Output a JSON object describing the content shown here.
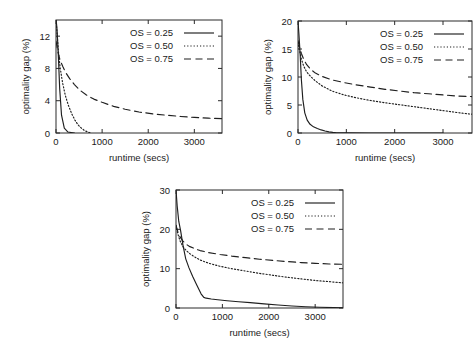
{
  "figure": {
    "background": "#ffffff",
    "ink": "#1f1f1f",
    "panel_count": 3
  },
  "legend": {
    "entries": [
      {
        "label": "OS = 0.25",
        "style": "solid"
      },
      {
        "label": "OS = 0.50",
        "style": "dotted"
      },
      {
        "label": "OS = 0.75",
        "style": "dashed"
      }
    ]
  },
  "chart_data": [
    {
      "id": "panel-top-left",
      "type": "line",
      "title": "",
      "xlabel": "runtime (secs)",
      "ylabel": "optimality gap (%)",
      "xlim": [
        0,
        3600
      ],
      "ylim": [
        0,
        14
      ],
      "xticks": [
        0,
        1000,
        2000,
        3000
      ],
      "yticks": [
        0,
        4,
        8,
        12
      ],
      "xticklabels": [
        "0",
        "1000",
        "2000",
        "3000"
      ],
      "yticklabels": [
        "0",
        "4",
        "8",
        "12"
      ],
      "grid": false,
      "legend_position": "top-right",
      "series": [
        {
          "name": "OS = 0.25",
          "style": "solid",
          "x": [
            0,
            10,
            20,
            35,
            55,
            80,
            120,
            180,
            260,
            400
          ],
          "y": [
            14.0,
            13.6,
            13.0,
            11.5,
            9.0,
            5.5,
            2.2,
            0.6,
            0.12,
            0.0
          ]
        },
        {
          "name": "OS = 0.50",
          "style": "dotted",
          "x": [
            0,
            20,
            50,
            90,
            140,
            200,
            270,
            340,
            410,
            480,
            550,
            620,
            700,
            760
          ],
          "y": [
            14.0,
            12.6,
            10.2,
            8.1,
            6.3,
            4.7,
            3.4,
            2.4,
            1.6,
            1.0,
            0.6,
            0.3,
            0.1,
            0.0
          ]
        },
        {
          "name": "OS = 0.75",
          "style": "dashed",
          "x": [
            0,
            40,
            90,
            150,
            220,
            300,
            400,
            520,
            660,
            820,
            1000,
            1250,
            1500,
            1800,
            2100,
            2400,
            2700,
            3000,
            3300,
            3600
          ],
          "y": [
            11.4,
            10.1,
            9.0,
            8.2,
            7.4,
            6.7,
            6.0,
            5.3,
            4.7,
            4.2,
            3.8,
            3.3,
            2.95,
            2.6,
            2.37,
            2.2,
            2.05,
            1.93,
            1.84,
            1.78
          ]
        }
      ]
    },
    {
      "id": "panel-top-right",
      "type": "line",
      "title": "",
      "xlabel": "runtime (secs)",
      "ylabel": "optimality gap (%)",
      "xlim": [
        0,
        3600
      ],
      "ylim": [
        0,
        20
      ],
      "xticks": [
        0,
        1000,
        2000,
        3000
      ],
      "yticks": [
        0,
        5,
        10,
        15,
        20
      ],
      "xticklabels": [
        "0",
        "1000",
        "2000",
        "3000"
      ],
      "yticklabels": [
        "0",
        "5",
        "10",
        "15",
        "20"
      ],
      "grid": false,
      "legend_position": "top-right",
      "series": [
        {
          "name": "OS = 0.25",
          "style": "solid",
          "x": [
            0,
            20,
            45,
            70,
            100,
            140,
            190,
            250,
            320,
            400,
            480,
            560,
            640,
            720,
            800,
            1000,
            1500,
            2000,
            2500,
            3000,
            3600
          ],
          "y": [
            20.0,
            17.5,
            14.0,
            9.5,
            6.0,
            3.6,
            2.3,
            1.55,
            1.1,
            0.8,
            0.55,
            0.35,
            0.2,
            0.1,
            0.05,
            0.02,
            0.0,
            0.0,
            0.0,
            0.0
          ]
        },
        {
          "name": "OS = 0.50",
          "style": "dotted",
          "x": [
            0,
            30,
            70,
            120,
            180,
            260,
            360,
            500,
            700,
            950,
            1200,
            1500,
            1800,
            2100,
            2400,
            2700,
            3000,
            3300,
            3600
          ],
          "y": [
            16.2,
            14.8,
            13.2,
            11.9,
            10.9,
            10.1,
            9.3,
            8.4,
            7.5,
            6.8,
            6.3,
            5.8,
            5.4,
            5.05,
            4.7,
            4.35,
            4.0,
            3.65,
            3.35
          ]
        },
        {
          "name": "OS = 0.75",
          "style": "dashed",
          "x": [
            0,
            30,
            70,
            120,
            180,
            260,
            360,
            500,
            700,
            950,
            1200,
            1500,
            1800,
            2100,
            2400,
            2700,
            3000,
            3300,
            3600
          ],
          "y": [
            16.5,
            15.4,
            14.2,
            13.1,
            12.2,
            11.4,
            10.7,
            10.1,
            9.5,
            9.0,
            8.6,
            8.2,
            7.8,
            7.5,
            7.2,
            7.0,
            6.8,
            6.6,
            6.5
          ]
        }
      ]
    },
    {
      "id": "panel-bottom-center",
      "type": "line",
      "title": "",
      "xlabel": "runtime (secs)",
      "ylabel": "optimality gap (%)",
      "xlim": [
        0,
        3600
      ],
      "ylim": [
        0,
        30
      ],
      "xticks": [
        0,
        1000,
        2000,
        3000
      ],
      "yticks": [
        0,
        10,
        20,
        30
      ],
      "xticklabels": [
        "0",
        "1000",
        "2000",
        "3000"
      ],
      "yticklabels": [
        "0",
        "10",
        "20",
        "30"
      ],
      "grid": false,
      "legend_position": "top-right",
      "series": [
        {
          "name": "OS = 0.25",
          "style": "solid",
          "x": [
            0,
            25,
            60,
            100,
            150,
            210,
            280,
            360,
            450,
            540,
            600,
            650,
            760,
            900,
            1100,
            1350,
            1600,
            1900,
            2200,
            2500,
            2800,
            3100,
            3400,
            3600
          ],
          "y": [
            30.0,
            26.0,
            22.0,
            19.6,
            16.0,
            12.5,
            10.2,
            8.0,
            5.8,
            3.6,
            2.7,
            2.5,
            2.3,
            2.1,
            1.85,
            1.6,
            1.35,
            1.05,
            0.75,
            0.5,
            0.32,
            0.2,
            0.1,
            0.05
          ]
        },
        {
          "name": "OS = 0.50",
          "style": "dotted",
          "x": [
            0,
            40,
            90,
            150,
            220,
            300,
            400,
            520,
            700,
            950,
            1200,
            1500,
            1800,
            2100,
            2400,
            2700,
            3000,
            3300,
            3600
          ],
          "y": [
            21.0,
            18.8,
            17.0,
            15.6,
            14.6,
            13.8,
            13.0,
            12.2,
            11.4,
            10.6,
            10.0,
            9.4,
            8.8,
            8.3,
            7.8,
            7.4,
            7.0,
            6.7,
            6.4
          ]
        },
        {
          "name": "OS = 0.75",
          "style": "dashed",
          "x": [
            0,
            40,
            90,
            150,
            220,
            300,
            400,
            520,
            700,
            950,
            1200,
            1500,
            1800,
            2100,
            2400,
            2700,
            3000,
            3300,
            3600
          ],
          "y": [
            21.0,
            19.4,
            18.0,
            17.0,
            16.2,
            15.6,
            15.1,
            14.6,
            14.1,
            13.6,
            13.2,
            12.8,
            12.4,
            12.1,
            11.8,
            11.55,
            11.35,
            11.2,
            11.1
          ]
        }
      ]
    }
  ]
}
